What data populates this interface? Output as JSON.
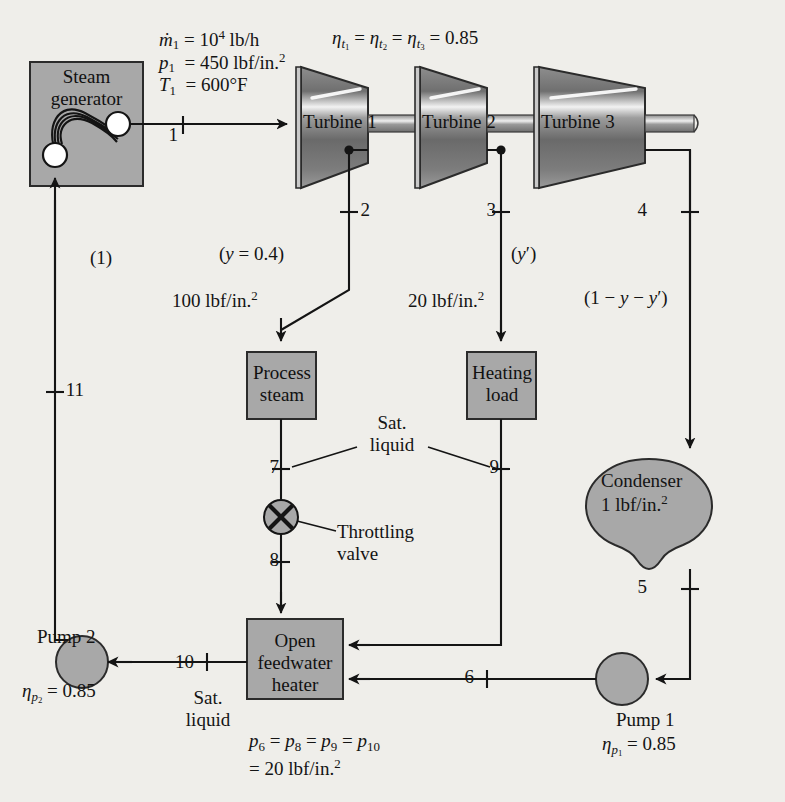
{
  "figure": {
    "colors": {
      "component_fill": "#a8a8a8",
      "component_stroke": "#2b2b2b",
      "line": "#1a1a1a",
      "background": "#efeeea",
      "node_fill": "#ffffff"
    }
  },
  "inlet_conditions": {
    "mass_flow": "ṁ1 = 104 lb/h",
    "pressure": "p1 = 450 lbf/in.2",
    "temperature": "T1 = 600°F"
  },
  "turbine_efficiency_note": "ηt1 = ηt2 = ηt3 = 0.85",
  "components": {
    "steam_generator": "Steam generator",
    "turbine_1": "Turbine 1",
    "turbine_2": "Turbine 2",
    "turbine_3": "Turbine 3",
    "process_steam": "Process steam",
    "heating_load": "Heating load",
    "condenser": "Condenser",
    "condenser_pressure": "1 lbf/in.2",
    "throttling_valve": "Throttling valve",
    "open_feedwater_heater": "Open feedwater heater",
    "pump_1": "Pump 1",
    "pump_2": "Pump 2"
  },
  "pump_efficiency": {
    "pump_1": "ηp1 = 0.85",
    "pump_2": "ηp2 = 0.85"
  },
  "state_points": [
    {
      "id": "1",
      "x": 180,
      "y": 137
    },
    {
      "id": "2",
      "x": 372,
      "y": 212
    },
    {
      "id": "3",
      "x": 498,
      "y": 212
    },
    {
      "id": "4",
      "x": 649,
      "y": 212
    },
    {
      "id": "5",
      "x": 649,
      "y": 589
    },
    {
      "id": "6",
      "x": 476,
      "y": 679
    },
    {
      "id": "7",
      "x": 281,
      "y": 469
    },
    {
      "id": "8",
      "x": 281,
      "y": 562
    },
    {
      "id": "9",
      "x": 501,
      "y": 469
    },
    {
      "id": "10",
      "x": 196,
      "y": 664
    },
    {
      "id": "11",
      "x": 86,
      "y": 392
    }
  ],
  "stream_labels": {
    "extraction_1_fraction": "(y = 0.4)",
    "extraction_1_pressure": "100 lbf/in.2",
    "extraction_2_fraction": "(y′)",
    "extraction_2_pressure": "20 lbf/in.2",
    "condenser_fraction": "(1 − y − y′)",
    "feed_fraction": "(1)",
    "sat_liquid_mid": "Sat. liquid",
    "sat_liquid_pump2": "Sat. liquid"
  },
  "pressure_note": {
    "line1": "p6 = p8 = p9 = p10",
    "line2": "= 20 lbf/in.2"
  }
}
